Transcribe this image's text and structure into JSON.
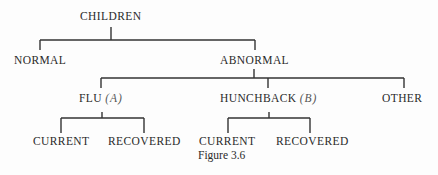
{
  "figure": {
    "caption": "Figure 3.6",
    "line_color": "#333333"
  },
  "tree": {
    "root": "CHILDREN",
    "level1": [
      "NORMAL",
      "ABNORMAL"
    ],
    "abnormal_children": [
      {
        "label": "FLU",
        "tag": "(A)"
      },
      {
        "label": "HUNCHBACK",
        "tag": "(B)"
      },
      {
        "label": "OTHER",
        "tag": ""
      }
    ],
    "flu_children": [
      "CURRENT",
      "RECOVERED"
    ],
    "hunchback_children": [
      "CURRENT",
      "RECOVERED"
    ]
  }
}
